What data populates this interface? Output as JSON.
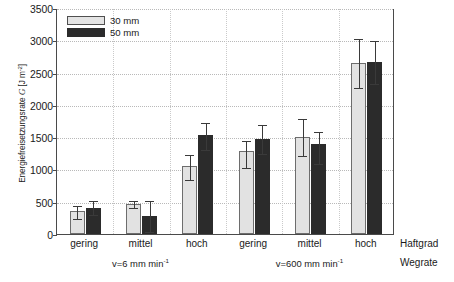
{
  "chart_data": {
    "type": "bar",
    "title": "",
    "xlabel_right_top": "Haftgrad",
    "xlabel_right_bottom": "Wegrate",
    "ylabel_prefix": "Energiefreisetzungsrate",
    "ylabel_symbol": "G",
    "ylabel_unit_open": " [J m",
    "ylabel_unit_exp": "-2",
    "ylabel_unit_close": "]",
    "ylabel_full": "Energiefreisetzungsrate G [J m-2]",
    "ylim": [
      0,
      3500
    ],
    "yticks": [
      0,
      500,
      1000,
      1500,
      2000,
      2500,
      3000,
      3500
    ],
    "ytick_labels": [
      "0",
      "500",
      "1000",
      "1500",
      "2000",
      "2500",
      "3000",
      "3500"
    ],
    "grid": "horizontal-dotted + vertical-dotted",
    "legend_position": "top-left inside plot",
    "categories": [
      "gering",
      "mittel",
      "hoch",
      "gering",
      "mittel",
      "hoch"
    ],
    "groups": [
      {
        "label": "v=6 mm min",
        "exp": "-1",
        "categories": [
          "gering",
          "mittel",
          "hoch"
        ]
      },
      {
        "label": "v=600 mm min",
        "exp": "-1",
        "categories": [
          "gering",
          "mittel",
          "hoch"
        ]
      }
    ],
    "series": [
      {
        "name": "30 mm",
        "color": "#e2e2e2",
        "values": [
          350,
          470,
          1060,
          1285,
          1500,
          2655
        ],
        "err_low": [
          250,
          425,
          855,
          1035,
          1220,
          2280
        ],
        "err_high": [
          450,
          520,
          1235,
          1450,
          1790,
          3040
        ]
      },
      {
        "name": "50 mm",
        "color": "#2b2b2b",
        "values": [
          410,
          275,
          1540,
          1475,
          1395,
          2670
        ],
        "err_low": [
          305,
          40,
          1310,
          1260,
          1105,
          2340
        ],
        "err_high": [
          520,
          520,
          1740,
          1700,
          1600,
          3000
        ]
      }
    ]
  },
  "legend": {
    "items": [
      {
        "label": "30 mm",
        "swatch": "light"
      },
      {
        "label": "50 mm",
        "swatch": "dark"
      }
    ]
  },
  "axes": {
    "right_labels": {
      "top": "Haftgrad",
      "bottom": "Wegrate"
    }
  },
  "caption": {
    "text": ""
  }
}
